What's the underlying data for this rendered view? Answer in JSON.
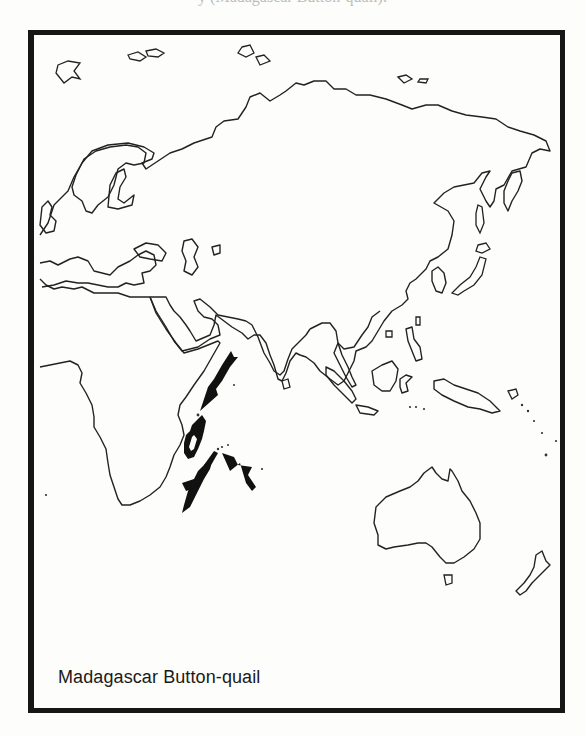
{
  "page": {
    "top_cropped_text": "y (Madagascar Button-quail)."
  },
  "map": {
    "title": "Madagascar Button-quail",
    "projection": "Eastern Hemisphere outline map (Europe, Asia, Africa, Australasia)",
    "colors": {
      "frame": "#161616",
      "coastline": "#222222",
      "range_fill": "#111111",
      "background": "#fdfdfb"
    },
    "range_highlight": {
      "region": "Madagascar",
      "style": "solid black thick outline"
    },
    "arrows": [
      {
        "id": "arrow-north",
        "points_to": "Comoros / northern Madagascar",
        "direction": "southwest"
      },
      {
        "id": "arrow-southwest",
        "points_to": "Réunion / Mauritius area",
        "direction": "northeast"
      },
      {
        "id": "arrow-southeast",
        "points_to": "Mascarene islands",
        "direction": "northwest"
      }
    ]
  }
}
